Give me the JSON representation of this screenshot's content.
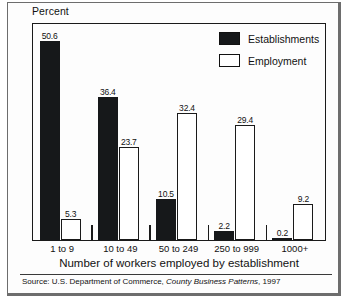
{
  "figure": {
    "y_axis_caption": "Percent",
    "x_axis_title": "Number of workers employed by establishment",
    "source_prefix": "Source: U.S. Department of Commerce,",
    "source_italic": "County Business Patterns",
    "source_suffix": ", 1997"
  },
  "legend": {
    "items": [
      {
        "label": "Establishments",
        "swatch": "filled",
        "color": "#16181a"
      },
      {
        "label": "Employment",
        "swatch": "hollow",
        "color": "#ffffff"
      }
    ]
  },
  "chart_data": {
    "type": "bar",
    "title": "",
    "xlabel": "Number of workers employed by establishment",
    "ylabel": "Percent",
    "ylim": [
      0,
      55
    ],
    "grid": false,
    "legend_position": "top-right",
    "categories": [
      "1 to 9",
      "10 to 49",
      "50 to 249",
      "250 to 999",
      "1000+"
    ],
    "series": [
      {
        "name": "Establishments",
        "values": [
          50.6,
          36.4,
          10.5,
          2.2,
          0.2
        ]
      },
      {
        "name": "Employment",
        "values": [
          5.3,
          23.7,
          32.4,
          29.4,
          9.2
        ]
      }
    ],
    "source": "Source: U.S. Department of Commerce, County Business Patterns, 1997"
  }
}
